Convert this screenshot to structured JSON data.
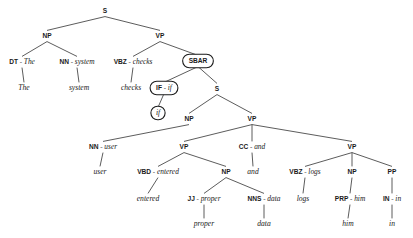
{
  "diagram": {
    "sentence": "The system checks if user entered proper data and logs him in",
    "separator": "-",
    "colors": {
      "background": "#ffffff",
      "edge": "#4a4a4a",
      "text": "#1a1a1a",
      "box_stroke": "#1a1a1a",
      "box_fill": "#ffffff"
    }
  },
  "nodes": [
    {
      "id": "s_root",
      "label": "S",
      "tag": "S",
      "word": "",
      "x": 105,
      "y": 11,
      "style": "plain"
    },
    {
      "id": "np_1",
      "label": "NP",
      "tag": "NP",
      "word": "",
      "x": 47,
      "y": 36,
      "style": "plain"
    },
    {
      "id": "vp_1",
      "label": "VP",
      "tag": "VP",
      "word": "",
      "x": 160,
      "y": 36,
      "style": "plain"
    },
    {
      "id": "dt_the",
      "label": "DT - The",
      "tag": "DT",
      "word": "The",
      "x": 22,
      "y": 62,
      "style": "plain"
    },
    {
      "id": "nn_system",
      "label": "NN - system",
      "tag": "NN",
      "word": "system",
      "x": 77,
      "y": 62,
      "style": "plain"
    },
    {
      "id": "lf_the",
      "label": "The",
      "tag": "",
      "word": "The",
      "x": 24,
      "y": 88,
      "style": "leaf"
    },
    {
      "id": "lf_system",
      "label": "system",
      "tag": "",
      "word": "system",
      "x": 79,
      "y": 88,
      "style": "leaf"
    },
    {
      "id": "vbz_checks",
      "label": "VBZ - checks",
      "tag": "VBZ",
      "word": "checks",
      "x": 133,
      "y": 62,
      "style": "plain"
    },
    {
      "id": "sbar",
      "label": "SBAR",
      "tag": "SBAR",
      "word": "",
      "x": 198,
      "y": 61,
      "style": "boxed"
    },
    {
      "id": "lf_checks",
      "label": "checks",
      "tag": "",
      "word": "checks",
      "x": 131,
      "y": 88,
      "style": "leaf"
    },
    {
      "id": "if_tag",
      "label": "IF - if",
      "tag": "IF",
      "word": "if",
      "x": 164,
      "y": 88,
      "style": "boxed"
    },
    {
      "id": "s_2",
      "label": "S",
      "tag": "S",
      "word": "",
      "x": 217,
      "y": 89,
      "style": "plain"
    },
    {
      "id": "lf_if",
      "label": "if",
      "tag": "",
      "word": "if",
      "x": 158,
      "y": 113,
      "style": "boxed-leaf"
    },
    {
      "id": "np_2",
      "label": "NP",
      "tag": "NP",
      "word": "",
      "x": 189,
      "y": 119,
      "style": "plain"
    },
    {
      "id": "vp_2",
      "label": "VP",
      "tag": "VP",
      "word": "",
      "x": 252,
      "y": 119,
      "style": "plain"
    },
    {
      "id": "nn_user",
      "label": "NN - user",
      "tag": "NN",
      "word": "user",
      "x": 103,
      "y": 147,
      "style": "plain"
    },
    {
      "id": "vp_3",
      "label": "VP",
      "tag": "VP",
      "word": "",
      "x": 184,
      "y": 147,
      "style": "plain"
    },
    {
      "id": "cc_and",
      "label": "CC - and",
      "tag": "CC",
      "word": "and",
      "x": 252,
      "y": 147,
      "style": "plain"
    },
    {
      "id": "vp_4",
      "label": "VP",
      "tag": "VP",
      "word": "",
      "x": 352,
      "y": 147,
      "style": "plain"
    },
    {
      "id": "lf_user",
      "label": "user",
      "tag": "",
      "word": "user",
      "x": 100,
      "y": 172,
      "style": "leaf"
    },
    {
      "id": "vbd_ent",
      "label": "VBD - entered",
      "tag": "VBD",
      "word": "entered",
      "x": 158,
      "y": 172,
      "style": "plain"
    },
    {
      "id": "np_3",
      "label": "NP",
      "tag": "NP",
      "word": "",
      "x": 226,
      "y": 172,
      "style": "plain"
    },
    {
      "id": "lf_and",
      "label": "and",
      "tag": "",
      "word": "and",
      "x": 253,
      "y": 172,
      "style": "leaf"
    },
    {
      "id": "vbz_logs",
      "label": "VBZ - logs",
      "tag": "VBZ",
      "word": "logs",
      "x": 305,
      "y": 172,
      "style": "plain"
    },
    {
      "id": "np_4",
      "label": "NP",
      "tag": "NP",
      "word": "",
      "x": 352,
      "y": 172,
      "style": "plain"
    },
    {
      "id": "pp_1",
      "label": "PP",
      "tag": "PP",
      "word": "",
      "x": 392,
      "y": 172,
      "style": "plain"
    },
    {
      "id": "lf_ent",
      "label": "entered",
      "tag": "",
      "word": "entered",
      "x": 148,
      "y": 199,
      "style": "leaf"
    },
    {
      "id": "jj_prop",
      "label": "JJ - proper",
      "tag": "JJ",
      "word": "proper",
      "x": 204,
      "y": 199,
      "style": "plain"
    },
    {
      "id": "nns_data",
      "label": "NNS - data",
      "tag": "NNS",
      "word": "data",
      "x": 264,
      "y": 199,
      "style": "plain"
    },
    {
      "id": "lf_logs",
      "label": "logs",
      "tag": "",
      "word": "logs",
      "x": 303,
      "y": 199,
      "style": "leaf"
    },
    {
      "id": "prp_him",
      "label": "PRP - him",
      "tag": "PRP",
      "word": "him",
      "x": 350,
      "y": 199,
      "style": "plain"
    },
    {
      "id": "in_in",
      "label": "IN - in",
      "tag": "IN",
      "word": "in",
      "x": 392,
      "y": 199,
      "style": "plain"
    },
    {
      "id": "lf_proper",
      "label": "proper",
      "tag": "",
      "word": "proper",
      "x": 204,
      "y": 224,
      "style": "leaf"
    },
    {
      "id": "lf_data",
      "label": "data",
      "tag": "",
      "word": "data",
      "x": 264,
      "y": 224,
      "style": "leaf"
    },
    {
      "id": "lf_him",
      "label": "him",
      "tag": "",
      "word": "him",
      "x": 348,
      "y": 224,
      "style": "leaf"
    },
    {
      "id": "lf_in",
      "label": "in",
      "tag": "",
      "word": "in",
      "x": 392,
      "y": 224,
      "style": "leaf"
    }
  ],
  "edges": [
    {
      "from": "s_root",
      "to": "np_1"
    },
    {
      "from": "s_root",
      "to": "vp_1"
    },
    {
      "from": "np_1",
      "to": "dt_the"
    },
    {
      "from": "np_1",
      "to": "nn_system"
    },
    {
      "from": "dt_the",
      "to": "lf_the"
    },
    {
      "from": "nn_system",
      "to": "lf_system"
    },
    {
      "from": "vp_1",
      "to": "vbz_checks"
    },
    {
      "from": "vp_1",
      "to": "sbar"
    },
    {
      "from": "vbz_checks",
      "to": "lf_checks"
    },
    {
      "from": "sbar",
      "to": "if_tag"
    },
    {
      "from": "sbar",
      "to": "s_2"
    },
    {
      "from": "if_tag",
      "to": "lf_if"
    },
    {
      "from": "s_2",
      "to": "np_2"
    },
    {
      "from": "s_2",
      "to": "vp_2"
    },
    {
      "from": "np_2",
      "to": "nn_user"
    },
    {
      "from": "vp_2",
      "to": "vp_3"
    },
    {
      "from": "vp_2",
      "to": "cc_and"
    },
    {
      "from": "vp_2",
      "to": "vp_4"
    },
    {
      "from": "nn_user",
      "to": "lf_user"
    },
    {
      "from": "vp_3",
      "to": "vbd_ent"
    },
    {
      "from": "vp_3",
      "to": "np_3"
    },
    {
      "from": "cc_and",
      "to": "lf_and"
    },
    {
      "from": "vp_4",
      "to": "vbz_logs"
    },
    {
      "from": "vp_4",
      "to": "np_4"
    },
    {
      "from": "vp_4",
      "to": "pp_1"
    },
    {
      "from": "vbd_ent",
      "to": "lf_ent"
    },
    {
      "from": "np_3",
      "to": "jj_prop"
    },
    {
      "from": "np_3",
      "to": "nns_data"
    },
    {
      "from": "vbz_logs",
      "to": "lf_logs"
    },
    {
      "from": "np_4",
      "to": "prp_him"
    },
    {
      "from": "pp_1",
      "to": "in_in"
    },
    {
      "from": "jj_prop",
      "to": "lf_proper"
    },
    {
      "from": "nns_data",
      "to": "lf_data"
    },
    {
      "from": "prp_him",
      "to": "lf_him"
    },
    {
      "from": "in_in",
      "to": "lf_in"
    }
  ]
}
